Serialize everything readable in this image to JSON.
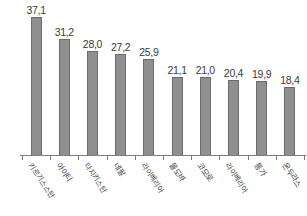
{
  "chart_data": {
    "type": "bar",
    "title": "",
    "subtitle": "",
    "xlabel": "",
    "ylabel": "",
    "grid": false,
    "legend": false,
    "ylim": [
      0,
      40
    ],
    "categories": [
      "키르기스스탄",
      "아이티",
      "타지키스탄",
      "네팔",
      "라이베리아",
      "몰도바",
      "코모로",
      "라이베리아",
      "통가",
      "온두라스"
    ],
    "values": [
      37.1,
      31.2,
      28.0,
      27.2,
      25.9,
      21.1,
      21.0,
      20.4,
      19.9,
      18.4
    ],
    "value_labels": [
      "37,1",
      "31,2",
      "28,0",
      "27,2",
      "25,9",
      "21,1",
      "21,0",
      "20,4",
      "19,9",
      "18,4"
    ],
    "bar_color": "#8f8f8f",
    "bar_border_color": "#6b6b6b",
    "axis_color": "#7d7d7d",
    "text_color": "#3a3a3a"
  }
}
